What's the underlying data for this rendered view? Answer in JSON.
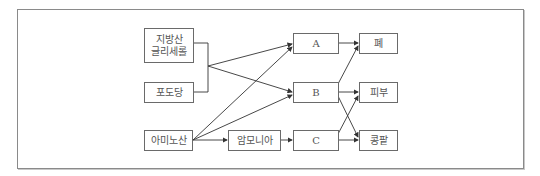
{
  "diagram": {
    "sources": {
      "fatty_acid_line1": "지방산",
      "fatty_acid_line2": "글리세롤",
      "glucose": "포도당",
      "amino_acid": "아미노산"
    },
    "intermediate": {
      "ammonia": "암모니아"
    },
    "products": {
      "a": "A",
      "b": "B",
      "c": "C"
    },
    "organs": {
      "lung": "폐",
      "skin": "피부",
      "kidney": "콩팥"
    },
    "edges": [
      {
        "from": "지방산 글리세롤 + 포도당",
        "to": "A"
      },
      {
        "from": "지방산 글리세롤 + 포도당",
        "to": "B"
      },
      {
        "from": "아미노산",
        "to": "A"
      },
      {
        "from": "아미노산",
        "to": "B"
      },
      {
        "from": "아미노산",
        "to": "암모니아"
      },
      {
        "from": "암모니아",
        "to": "C"
      },
      {
        "from": "A",
        "to": "폐"
      },
      {
        "from": "B",
        "to": "폐"
      },
      {
        "from": "B",
        "to": "피부"
      },
      {
        "from": "B",
        "to": "콩팥"
      },
      {
        "from": "C",
        "to": "피부"
      },
      {
        "from": "C",
        "to": "콩팥"
      }
    ],
    "colors": {
      "line": "#333333",
      "box_border": "#6a6a6a",
      "frame_border": "#8a8a8a",
      "text": "#555555"
    }
  }
}
